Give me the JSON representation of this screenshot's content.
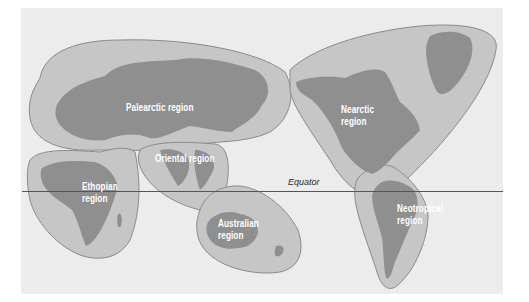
{
  "map": {
    "title": "Zoogeographic regions of the world",
    "colors": {
      "background": "#ffffff",
      "panel": "#ececec",
      "region_fill": "#c6c6c6",
      "region_stroke": "#8a8a8a",
      "land": "#8f8f8f",
      "label_text": "#ffffff",
      "equator": "#555555"
    },
    "regions": [
      {
        "name": "palearctic",
        "label": "Palearctic region"
      },
      {
        "name": "nearctic",
        "label": "Nearctic\nregion"
      },
      {
        "name": "oriental",
        "label": "Oriental region"
      },
      {
        "name": "ethiopian",
        "label": "Ethopian\nregion"
      },
      {
        "name": "australian",
        "label": "Australian\nregion"
      },
      {
        "name": "neotropical",
        "label": "Neotropical\nregion"
      }
    ],
    "equator_label": "Equator"
  }
}
